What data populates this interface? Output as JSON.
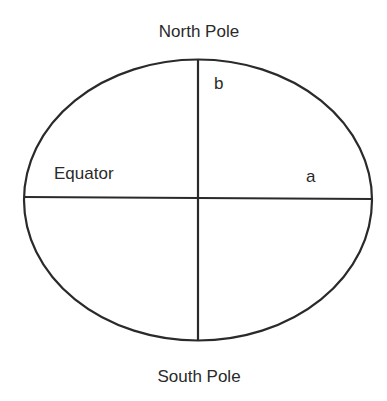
{
  "diagram": {
    "labels": {
      "north_pole": "North Pole",
      "south_pole": "South Pole",
      "equator": "Equator",
      "semi_major_axis": "a",
      "semi_minor_axis": "b"
    },
    "colors": {
      "stroke": "#2a2a2a",
      "background": "#ffffff",
      "text": "#2a2a2a"
    }
  }
}
